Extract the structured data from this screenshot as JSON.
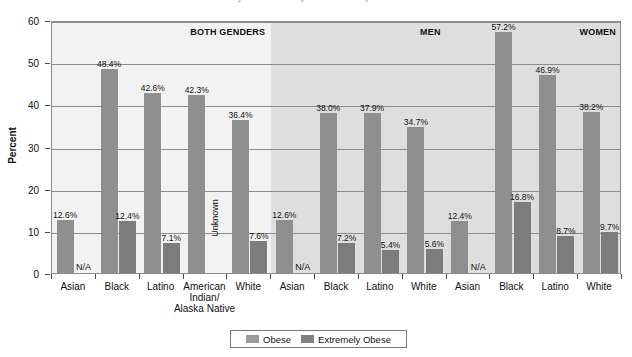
{
  "title_sliver": "Obesity Prevalence by Race/Ethnicity and Gender",
  "legend": {
    "items": [
      {
        "label": "Obese",
        "color": "#9a9a9a",
        "key": "obese"
      },
      {
        "label": "Extremely Obese",
        "color": "#808080",
        "key": "extreme"
      }
    ]
  },
  "chart_data": {
    "type": "bar",
    "title": "",
    "xlabel": "",
    "ylabel": "Percent",
    "ylim": [
      0,
      60
    ],
    "yticks": [
      0,
      10,
      20,
      30,
      40,
      50,
      60
    ],
    "ytick_labels": [
      "0",
      "10",
      "20",
      "30",
      "40",
      "50",
      "60"
    ],
    "grid": true,
    "legend_position": "bottom",
    "group_labels": [
      "BOTH GENDERS",
      "MEN",
      "WOMEN"
    ],
    "groups": [
      {
        "name": "BOTH GENDERS",
        "categories": [
          {
            "label": "Asian",
            "obese": 12.6,
            "obese_label": "12.6%",
            "extreme": null,
            "extreme_label": "N/A"
          },
          {
            "label": "Black",
            "obese": 48.4,
            "obese_label": "48.4%",
            "extreme": 12.4,
            "extreme_label": "12.4%"
          },
          {
            "label": "Latino",
            "obese": 42.6,
            "obese_label": "42.6%",
            "extreme": 7.1,
            "extreme_label": "7.1%"
          },
          {
            "label": "American Indian/ Alaska Native",
            "obese": 42.3,
            "obese_label": "42.3%",
            "extreme": null,
            "extreme_label": "Unknown"
          },
          {
            "label": "White",
            "obese": 36.4,
            "obese_label": "36.4%",
            "extreme": 7.6,
            "extreme_label": "7.6%"
          }
        ]
      },
      {
        "name": "MEN",
        "categories": [
          {
            "label": "Asian",
            "obese": 12.6,
            "obese_label": "12.6%",
            "extreme": null,
            "extreme_label": "N/A"
          },
          {
            "label": "Black",
            "obese": 38.0,
            "obese_label": "38.0%",
            "extreme": 7.2,
            "extreme_label": "7.2%"
          },
          {
            "label": "Latino",
            "obese": 37.9,
            "obese_label": "37.9%",
            "extreme": 5.4,
            "extreme_label": "5.4%"
          },
          {
            "label": "White",
            "obese": 34.7,
            "obese_label": "34.7%",
            "extreme": 5.6,
            "extreme_label": "5.6%"
          }
        ]
      },
      {
        "name": "WOMEN",
        "categories": [
          {
            "label": "Asian",
            "obese": 12.4,
            "obese_label": "12.4%",
            "extreme": null,
            "extreme_label": "N/A"
          },
          {
            "label": "Black",
            "obese": 57.2,
            "obese_label": "57.2%",
            "extreme": 16.8,
            "extreme_label": "16.8%"
          },
          {
            "label": "Latino",
            "obese": 46.9,
            "obese_label": "46.9%",
            "extreme": 8.7,
            "extreme_label": "8.7%"
          },
          {
            "label": "White",
            "obese": 38.2,
            "obese_label": "38.2%",
            "extreme": 9.7,
            "extreme_label": "9.7%"
          }
        ]
      }
    ],
    "series": [
      {
        "name": "Obese",
        "values": [
          12.6,
          48.4,
          42.6,
          42.3,
          36.4,
          12.6,
          38.0,
          37.9,
          34.7,
          12.4,
          57.2,
          46.9,
          38.2
        ]
      },
      {
        "name": "Extremely Obese",
        "values": [
          null,
          12.4,
          7.1,
          null,
          7.6,
          null,
          7.2,
          5.4,
          5.6,
          null,
          16.8,
          8.7,
          9.7
        ]
      }
    ],
    "categories": [
      "Asian",
      "Black",
      "Latino",
      "American Indian/ Alaska Native",
      "White",
      "Asian",
      "Black",
      "Latino",
      "White",
      "Asian",
      "Black",
      "Latino",
      "White"
    ]
  },
  "colors": {
    "obese": "#9a9a9a",
    "extreme": "#808080",
    "band_light": "#f2f2f2",
    "band_dark": "#dedede",
    "grid": "#8c8c8c",
    "text": "#111111"
  }
}
